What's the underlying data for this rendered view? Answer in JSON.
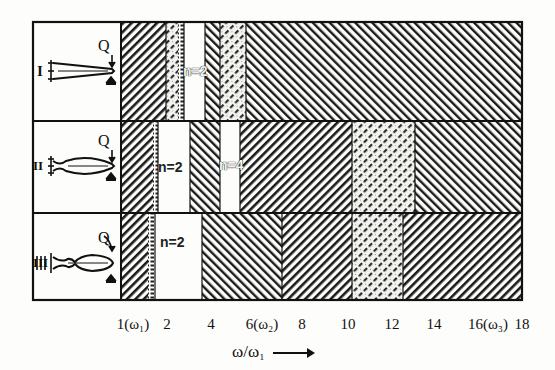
{
  "figure": {
    "type": "stability-region diagram",
    "x_axis": {
      "label": "ω/ω₁",
      "arrow": "→",
      "ticks": [
        {
          "value": 1,
          "label": "1(ω₁)"
        },
        {
          "value": 2,
          "label": "2"
        },
        {
          "value": 4,
          "label": "4"
        },
        {
          "value": 6,
          "label": "6(ω₂)"
        },
        {
          "value": 8,
          "label": "8"
        },
        {
          "value": 10,
          "label": "10"
        },
        {
          "value": 12,
          "label": "12"
        },
        {
          "value": 14,
          "label": "14"
        },
        {
          "value": 16,
          "label": "16(ω₃)"
        },
        {
          "value": 18,
          "label": "18"
        }
      ]
    },
    "rows": [
      {
        "id": "I",
        "label": "I",
        "load_label": "Q",
        "specimen_shape": "tapered cantilever",
        "annotations": [
          {
            "text": "n=2"
          }
        ],
        "bands": [
          {
            "from": 1.0,
            "to": 2.0,
            "pattern": "hatch-right-dense"
          },
          {
            "from": 2.0,
            "to": 2.5,
            "pattern": "hatch-right-light"
          },
          {
            "from": 2.5,
            "to": 2.8,
            "pattern": "dotted"
          },
          {
            "from": 2.8,
            "to": 3.7,
            "pattern": "blank"
          },
          {
            "from": 3.7,
            "to": 4.4,
            "pattern": "hatch-left"
          },
          {
            "from": 4.4,
            "to": 5.3,
            "pattern": "hatch-right-light"
          },
          {
            "from": 5.3,
            "to": 18.0,
            "pattern": "hatch-left"
          }
        ]
      },
      {
        "id": "II",
        "label": "II",
        "load_label": "Q",
        "specimen_shape": "spindle cantilever",
        "annotations": [
          {
            "text": "n=2"
          },
          {
            "text": "n=4"
          }
        ],
        "bands": [
          {
            "from": 1.0,
            "to": 1.6,
            "pattern": "hatch-right-dense"
          },
          {
            "from": 1.6,
            "to": 1.8,
            "pattern": "dotted"
          },
          {
            "from": 1.8,
            "to": 3.2,
            "pattern": "blank"
          },
          {
            "from": 3.2,
            "to": 4.4,
            "pattern": "hatch-left"
          },
          {
            "from": 4.4,
            "to": 5.2,
            "pattern": "blank"
          },
          {
            "from": 5.2,
            "to": 10.0,
            "pattern": "hatch-right-dense"
          },
          {
            "from": 10.0,
            "to": 12.8,
            "pattern": "hatch-right-light"
          },
          {
            "from": 12.8,
            "to": 18.0,
            "pattern": "hatch-left"
          }
        ]
      },
      {
        "id": "III",
        "label": "III",
        "load_label": "Q",
        "specimen_shape": "necked cantilever",
        "annotations": [
          {
            "text": "n=2"
          }
        ],
        "bands": [
          {
            "from": 1.0,
            "to": 1.5,
            "pattern": "hatch-right-dense"
          },
          {
            "from": 1.5,
            "to": 1.7,
            "pattern": "dotted"
          },
          {
            "from": 1.7,
            "to": 3.8,
            "pattern": "blank"
          },
          {
            "from": 3.8,
            "to": 7.0,
            "pattern": "hatch-left"
          },
          {
            "from": 7.0,
            "to": 10.0,
            "pattern": "hatch-right-dense"
          },
          {
            "from": 10.0,
            "to": 12.4,
            "pattern": "hatch-right-light"
          },
          {
            "from": 12.4,
            "to": 18.0,
            "pattern": "hatch-right-dense"
          }
        ]
      }
    ]
  },
  "colors": {
    "ink": "#111111",
    "paper": "#fdfdfb"
  }
}
